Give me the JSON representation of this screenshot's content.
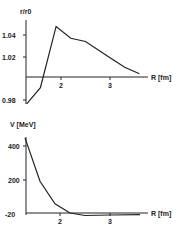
{
  "chart_data": [
    {
      "type": "line",
      "title": "",
      "ylabel": "r/r0",
      "xlabel": "R [fm]",
      "x_ticks": [
        "2",
        "3"
      ],
      "y_ticks": [
        "1.04",
        "1.02",
        "0.98"
      ],
      "xlim": [
        1.3,
        3.7
      ],
      "ylim": [
        0.975,
        1.05
      ],
      "grid": false,
      "series": [
        {
          "name": "ratio",
          "x": [
            1.3,
            1.58,
            1.9,
            2.2,
            2.5,
            3.0,
            3.3,
            3.6
          ],
          "y": [
            0.975,
            0.99,
            1.047,
            1.036,
            1.033,
            1.018,
            1.009,
            1.003
          ]
        }
      ]
    },
    {
      "type": "line",
      "title": "",
      "ylabel": "V [MeV]",
      "xlabel": "R [fm]",
      "x_ticks": [
        "2",
        "3"
      ],
      "y_ticks": [
        "400",
        "200",
        "-20"
      ],
      "xlim": [
        1.3,
        3.7
      ],
      "ylim": [
        -20,
        460
      ],
      "grid": false,
      "series": [
        {
          "name": "potential",
          "x": [
            1.3,
            1.6,
            1.9,
            2.2,
            2.5,
            3.0,
            3.6
          ],
          "y": [
            450,
            190,
            55,
            0,
            -15,
            -12,
            -10
          ]
        }
      ]
    }
  ]
}
